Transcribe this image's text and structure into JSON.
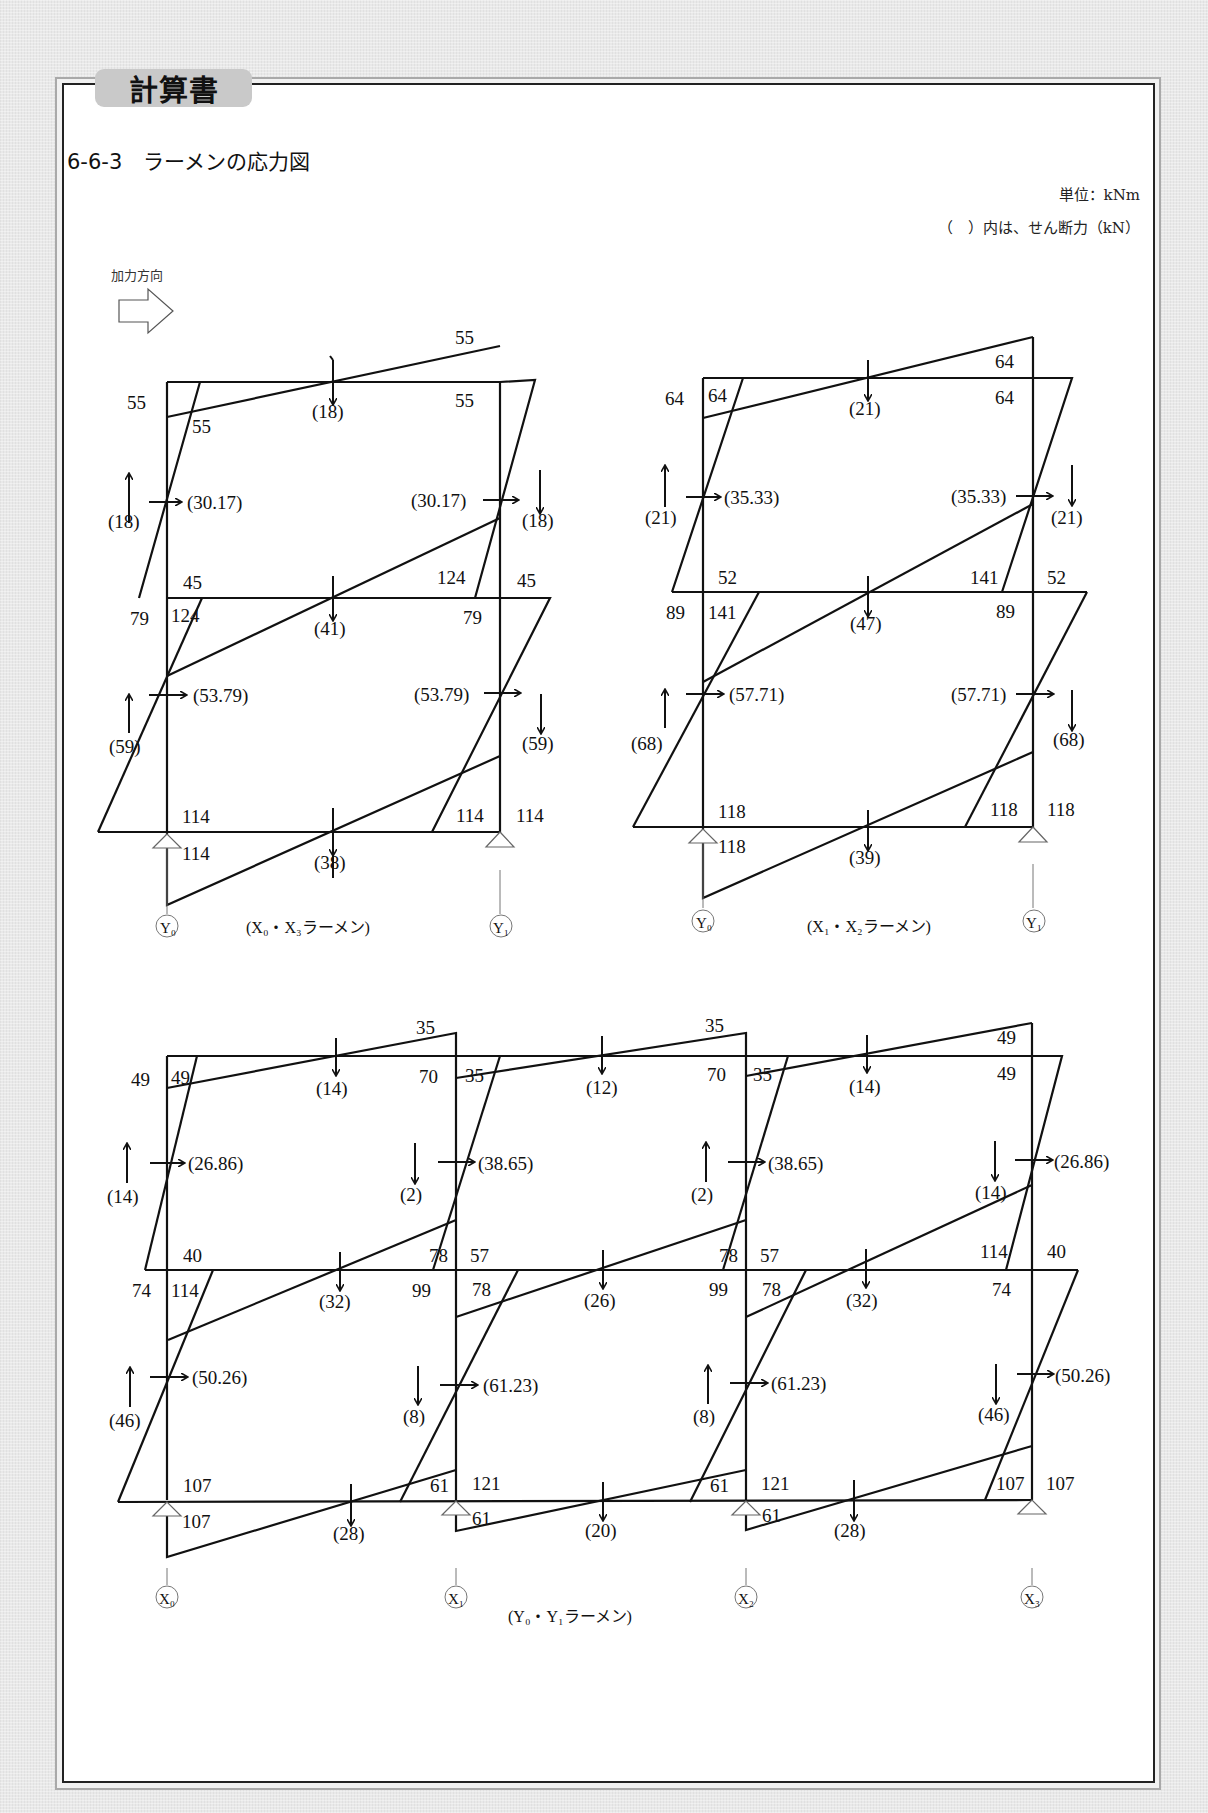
{
  "header": {
    "tab_label": "計算書",
    "section_title": "6-6-3　ラーメンの応力図",
    "unit_note": "単位：kNm",
    "shear_note": "（　）内は、せん断力（kN）",
    "load_direction_label": "加力方向"
  },
  "diagrams": [
    {
      "caption": "(X₀・X₃ラーメン)",
      "axes": [
        "Y₀",
        "Y₁"
      ],
      "upper_story": {
        "beam_moments": {
          "left_outer": "55",
          "left_inner": "55",
          "right_top": "55",
          "right_inner": "55"
        },
        "beam_shear": "(18)",
        "column_shear": {
          "left": "(30.17)",
          "right": "(30.17)"
        },
        "axial": {
          "left": "(18)",
          "right": "(18)"
        },
        "column_bottom_moments": {
          "left": "45",
          "right": "45"
        }
      },
      "lower_story": {
        "beam_moments": {
          "left_outer": "79",
          "left_inner": "124",
          "right_top": "124",
          "right_inner": "79"
        },
        "beam_shear": "(41)",
        "column_shear": {
          "left": "(53.79)",
          "right": "(53.79)"
        },
        "axial": {
          "left": "(59)",
          "right": "(59)"
        }
      },
      "foundation": {
        "moments": {
          "left_top": "114",
          "left_bottom": "114",
          "right_inner": "114",
          "right_outer": "114"
        },
        "beam_shear": "(38)"
      }
    },
    {
      "caption": "(X₁・X₂ラーメン)",
      "axes": [
        "Y₀",
        "Y₁"
      ],
      "upper_story": {
        "beam_moments": {
          "left_outer": "64",
          "left_inner": "64",
          "right_top": "64",
          "right_inner": "64"
        },
        "beam_shear": "(21)",
        "column_shear": {
          "left": "(35.33)",
          "right": "(35.33)"
        },
        "axial": {
          "left": "(21)",
          "right": "(21)"
        },
        "column_bottom_moments": {
          "left": "52",
          "right": "52"
        }
      },
      "lower_story": {
        "beam_moments": {
          "left_outer": "89",
          "left_inner": "141",
          "right_top": "141",
          "right_inner": "89"
        },
        "beam_shear": "(47)",
        "column_shear": {
          "left": "(57.71)",
          "right": "(57.71)"
        },
        "axial": {
          "left": "(68)",
          "right": "(68)"
        }
      },
      "foundation": {
        "moments": {
          "left_top": "118",
          "left_bottom": "118",
          "right_inner": "118",
          "right_outer": "118"
        },
        "beam_shear": "(39)"
      }
    },
    {
      "caption": "(Y₀・Y₁ラーメン)",
      "axes": [
        "X₀",
        "X₁",
        "X₂",
        "X₃"
      ],
      "upper_story": {
        "spans": [
          {
            "left_moment": "49",
            "left_outer": "49",
            "right_top": "35",
            "right_inner": "70",
            "beam_shear": "(14)"
          },
          {
            "left_moment": "35",
            "right_top": "35",
            "right_inner": "70",
            "beam_shear": "(12)"
          },
          {
            "left_moment": "35",
            "right_top": "49",
            "right_inner": "49",
            "beam_shear": "(14)"
          }
        ],
        "column_shear": [
          "(26.86)",
          "(38.65)",
          "(38.65)",
          "(26.86)"
        ],
        "axial": [
          "(14)",
          "(2)",
          "(2)",
          "(14)"
        ],
        "column_bottom_moments": [
          "40",
          "78",
          "78",
          "114"
        ],
        "column_bottom_moments_right": [
          "",
          "57",
          "57",
          "40"
        ]
      },
      "lower_story": {
        "spans": [
          {
            "left_outer": "74",
            "left_inner": "114",
            "right_inner": "99",
            "beam_shear": "(32)"
          },
          {
            "left_inner": "78",
            "right_inner": "99",
            "beam_shear": "(26)"
          },
          {
            "left_inner": "78",
            "right_inner": "74",
            "beam_shear": "(32)"
          }
        ],
        "column_shear": [
          "(50.26)",
          "(61.23)",
          "(61.23)",
          "(50.26)"
        ],
        "axial": [
          "(46)",
          "(8)",
          "(8)",
          "(46)"
        ]
      },
      "foundation": {
        "top_moments": [
          "107",
          "121",
          "121",
          "107"
        ],
        "col_moments_right": [
          "61",
          "61",
          "107"
        ],
        "bottom_moments": [
          "107",
          "61",
          "61"
        ],
        "beam_shear": [
          "(28)",
          "(20)",
          "(28)"
        ]
      }
    }
  ]
}
